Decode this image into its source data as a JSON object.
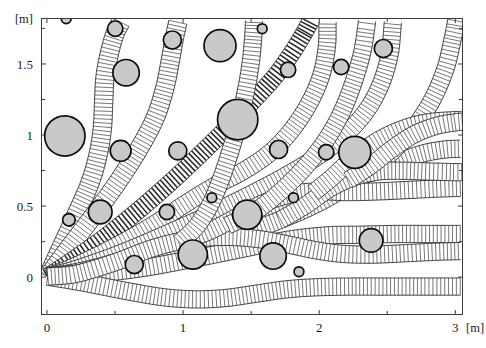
{
  "figure": {
    "type": "path-swath-obstacle-plot",
    "x_unit_label": "[m]",
    "y_unit_label": "[m]",
    "caption": ""
  },
  "axes": {
    "x": {
      "min": -0.04,
      "max": 3.06,
      "major_ticks": [
        0,
        1,
        2,
        3
      ],
      "major_labels": [
        "0",
        "1",
        "2",
        "3"
      ],
      "minor_ticks": [
        0.5,
        1.5,
        2.5
      ],
      "label": "[m]"
    },
    "y": {
      "min": -0.27,
      "max": 1.82,
      "major_ticks": [
        0,
        0.5,
        1,
        1.5
      ],
      "major_labels": [
        "0",
        "0.5",
        "1",
        "1.5"
      ],
      "minor_ticks": [
        0.25,
        0.75,
        1.25,
        1.75
      ],
      "label": "[m]"
    }
  },
  "plot_box_px": {
    "left": 41,
    "top": 18,
    "right": 463,
    "bottom": 315
  },
  "obstacles": [
    {
      "cx": 0.135,
      "cy": 0.99,
      "r": 0.145
    },
    {
      "cx": 0.165,
      "cy": 0.4,
      "r": 0.045
    },
    {
      "cx": 0.145,
      "cy": 1.815,
      "r": 0.035
    },
    {
      "cx": 0.395,
      "cy": 0.455,
      "r": 0.085
    },
    {
      "cx": 0.505,
      "cy": 1.745,
      "r": 0.055
    },
    {
      "cx": 0.545,
      "cy": 0.885,
      "r": 0.075
    },
    {
      "cx": 0.585,
      "cy": 1.435,
      "r": 0.095
    },
    {
      "cx": 0.645,
      "cy": 0.085,
      "r": 0.065
    },
    {
      "cx": 0.885,
      "cy": 0.455,
      "r": 0.055
    },
    {
      "cx": 0.925,
      "cy": 1.665,
      "r": 0.065
    },
    {
      "cx": 0.965,
      "cy": 0.885,
      "r": 0.065
    },
    {
      "cx": 1.075,
      "cy": 0.155,
      "r": 0.105
    },
    {
      "cx": 1.215,
      "cy": 0.555,
      "r": 0.035
    },
    {
      "cx": 1.275,
      "cy": 1.625,
      "r": 0.115
    },
    {
      "cx": 1.405,
      "cy": 1.105,
      "r": 0.145
    },
    {
      "cx": 1.475,
      "cy": 0.435,
      "r": 0.105
    },
    {
      "cx": 1.585,
      "cy": 1.745,
      "r": 0.035
    },
    {
      "cx": 1.665,
      "cy": 0.145,
      "r": 0.095
    },
    {
      "cx": 1.705,
      "cy": 0.895,
      "r": 0.065
    },
    {
      "cx": 1.775,
      "cy": 1.455,
      "r": 0.055
    },
    {
      "cx": 1.815,
      "cy": 0.555,
      "r": 0.035
    },
    {
      "cx": 1.855,
      "cy": 0.035,
      "r": 0.035
    },
    {
      "cx": 2.055,
      "cy": 0.875,
      "r": 0.055
    },
    {
      "cx": 2.165,
      "cy": 1.475,
      "r": 0.055
    },
    {
      "cx": 2.265,
      "cy": 0.875,
      "r": 0.115
    },
    {
      "cx": 2.385,
      "cy": 0.255,
      "r": 0.085
    },
    {
      "cx": 2.475,
      "cy": 1.605,
      "r": 0.065
    }
  ],
  "swaths": [
    {
      "id": "s1",
      "shade": "light",
      "half_width": 0.066,
      "pts": [
        [
          0.01,
          0.0
        ],
        [
          0.1,
          0.19
        ],
        [
          0.22,
          0.44
        ],
        [
          0.32,
          0.66
        ],
        [
          0.38,
          0.86
        ],
        [
          0.41,
          1.04
        ],
        [
          0.42,
          1.22
        ],
        [
          0.43,
          1.4
        ],
        [
          0.46,
          1.56
        ],
        [
          0.5,
          1.7
        ],
        [
          0.545,
          1.79
        ]
      ]
    },
    {
      "id": "s2",
      "shade": "light",
      "half_width": 0.066,
      "pts": [
        [
          0.01,
          0.0
        ],
        [
          0.14,
          0.17
        ],
        [
          0.33,
          0.41
        ],
        [
          0.52,
          0.66
        ],
        [
          0.68,
          0.9
        ],
        [
          0.8,
          1.12
        ],
        [
          0.87,
          1.33
        ],
        [
          0.91,
          1.52
        ],
        [
          0.94,
          1.68
        ],
        [
          0.965,
          1.79
        ]
      ]
    },
    {
      "id": "s3",
      "shade": "dark",
      "half_width": 0.062,
      "pts": [
        [
          0.01,
          0.0
        ],
        [
          0.17,
          0.1
        ],
        [
          0.42,
          0.27
        ],
        [
          0.68,
          0.47
        ],
        [
          0.93,
          0.68
        ],
        [
          1.14,
          0.87
        ],
        [
          1.33,
          1.05
        ],
        [
          1.52,
          1.24
        ],
        [
          1.68,
          1.41
        ],
        [
          1.8,
          1.57
        ],
        [
          1.89,
          1.71
        ],
        [
          1.94,
          1.8
        ]
      ]
    },
    {
      "id": "s4",
      "shade": "light",
      "half_width": 0.062,
      "pts": [
        [
          0.01,
          0.0
        ],
        [
          0.2,
          0.07
        ],
        [
          0.48,
          0.2
        ],
        [
          0.76,
          0.35
        ],
        [
          1.0,
          0.5
        ],
        [
          1.22,
          0.63
        ],
        [
          1.44,
          0.74
        ],
        [
          1.64,
          0.87
        ],
        [
          1.8,
          1.03
        ],
        [
          1.93,
          1.22
        ],
        [
          2.02,
          1.42
        ],
        [
          2.06,
          1.62
        ],
        [
          2.065,
          1.79
        ]
      ]
    },
    {
      "id": "s5",
      "shade": "light",
      "half_width": 0.062,
      "pts": [
        [
          0.01,
          0.0
        ],
        [
          0.24,
          0.06
        ],
        [
          0.56,
          0.17
        ],
        [
          0.88,
          0.3
        ],
        [
          1.18,
          0.43
        ],
        [
          1.46,
          0.56
        ],
        [
          1.72,
          0.69
        ],
        [
          1.95,
          0.82
        ],
        [
          2.15,
          0.96
        ],
        [
          2.33,
          1.14
        ],
        [
          2.45,
          1.34
        ],
        [
          2.52,
          1.56
        ],
        [
          2.545,
          1.79
        ]
      ]
    },
    {
      "id": "s6",
      "shade": "light",
      "half_width": 0.062,
      "pts": [
        [
          0.01,
          0.0
        ],
        [
          0.26,
          0.04
        ],
        [
          0.62,
          0.13
        ],
        [
          0.98,
          0.24
        ],
        [
          1.33,
          0.36
        ],
        [
          1.66,
          0.48
        ],
        [
          1.96,
          0.59
        ],
        [
          2.22,
          0.68
        ],
        [
          2.44,
          0.75
        ],
        [
          2.62,
          0.82
        ],
        [
          2.78,
          0.87
        ],
        [
          2.93,
          0.895
        ],
        [
          3.04,
          0.9
        ]
      ]
    },
    {
      "id": "s7",
      "shade": "light",
      "half_width": 0.062,
      "pts": [
        [
          0.01,
          0.0
        ],
        [
          0.28,
          0.03
        ],
        [
          0.66,
          0.1
        ],
        [
          1.04,
          0.19
        ],
        [
          1.4,
          0.29
        ],
        [
          1.72,
          0.4
        ],
        [
          2.0,
          0.52
        ],
        [
          2.25,
          0.66
        ],
        [
          2.47,
          0.82
        ],
        [
          2.66,
          1.0
        ],
        [
          2.82,
          1.22
        ],
        [
          2.93,
          1.46
        ],
        [
          2.99,
          1.7
        ],
        [
          3.01,
          1.8
        ]
      ]
    },
    {
      "id": "s8",
      "shade": "light",
      "half_width": 0.062,
      "pts": [
        [
          0.01,
          0.0
        ],
        [
          0.3,
          0.015
        ],
        [
          0.7,
          0.06
        ],
        [
          1.1,
          0.13
        ],
        [
          1.46,
          0.2
        ],
        [
          1.78,
          0.26
        ],
        [
          2.06,
          0.29
        ],
        [
          2.32,
          0.295
        ],
        [
          2.56,
          0.3
        ],
        [
          2.8,
          0.3
        ],
        [
          3.04,
          0.3
        ]
      ]
    },
    {
      "id": "s9",
      "shade": "light",
      "half_width": 0.062,
      "pts": [
        [
          0.01,
          0.0
        ],
        [
          0.26,
          -0.04
        ],
        [
          0.58,
          -0.1
        ],
        [
          0.86,
          -0.145
        ],
        [
          1.1,
          -0.16
        ],
        [
          1.32,
          -0.15
        ],
        [
          1.54,
          -0.12
        ],
        [
          1.76,
          -0.09
        ],
        [
          1.98,
          -0.075
        ],
        [
          2.22,
          -0.07
        ],
        [
          2.5,
          -0.07
        ],
        [
          2.78,
          -0.07
        ],
        [
          3.04,
          -0.07
        ]
      ]
    },
    {
      "id": "s10",
      "shade": "light",
      "half_width": 0.062,
      "pts": [
        [
          0.01,
          0.0
        ],
        [
          0.22,
          0.02
        ],
        [
          0.5,
          0.1
        ],
        [
          0.78,
          0.2
        ],
        [
          1.04,
          0.26
        ],
        [
          1.3,
          0.28
        ],
        [
          1.55,
          0.265
        ],
        [
          1.78,
          0.225
        ],
        [
          1.98,
          0.185
        ],
        [
          2.18,
          0.16
        ],
        [
          2.4,
          0.155
        ],
        [
          2.64,
          0.165
        ],
        [
          2.86,
          0.175
        ],
        [
          3.04,
          0.18
        ]
      ]
    },
    {
      "id": "s11",
      "shade": "light",
      "half_width": 0.062,
      "pts": [
        [
          1.04,
          0.26
        ],
        [
          1.22,
          0.33
        ],
        [
          1.42,
          0.43
        ],
        [
          1.6,
          0.52
        ],
        [
          1.8,
          0.58
        ],
        [
          2.0,
          0.6
        ],
        [
          2.22,
          0.595
        ],
        [
          2.44,
          0.6
        ],
        [
          2.66,
          0.61
        ],
        [
          2.88,
          0.62
        ],
        [
          3.04,
          0.625
        ]
      ]
    },
    {
      "id": "s12",
      "shade": "light",
      "half_width": 0.062,
      "pts": [
        [
          1.72,
          0.4
        ],
        [
          1.9,
          0.5
        ],
        [
          2.08,
          0.62
        ],
        [
          2.26,
          0.7
        ],
        [
          2.44,
          0.74
        ],
        [
          2.62,
          0.745
        ],
        [
          2.8,
          0.74
        ],
        [
          3.0,
          0.735
        ],
        [
          3.05,
          0.735
        ]
      ]
    },
    {
      "id": "s13",
      "shade": "light",
      "half_width": 0.062,
      "pts": [
        [
          1.33,
          0.36
        ],
        [
          1.5,
          0.44
        ],
        [
          1.66,
          0.55
        ],
        [
          1.82,
          0.69
        ],
        [
          1.96,
          0.84
        ],
        [
          2.08,
          1.0
        ],
        [
          2.18,
          1.18
        ],
        [
          2.26,
          1.38
        ],
        [
          2.32,
          1.58
        ],
        [
          2.35,
          1.76
        ],
        [
          2.355,
          1.8
        ]
      ]
    },
    {
      "id": "s14",
      "shade": "light",
      "half_width": 0.062,
      "pts": [
        [
          0.98,
          0.24
        ],
        [
          1.1,
          0.35
        ],
        [
          1.2,
          0.5
        ],
        [
          1.28,
          0.68
        ],
        [
          1.35,
          0.88
        ],
        [
          1.41,
          1.08
        ],
        [
          1.46,
          1.28
        ],
        [
          1.5,
          1.5
        ],
        [
          1.52,
          1.7
        ],
        [
          1.525,
          1.8
        ]
      ]
    },
    {
      "id": "s15",
      "shade": "light",
      "half_width": 0.062,
      "pts": [
        [
          1.96,
          0.59
        ],
        [
          2.1,
          0.7
        ],
        [
          2.26,
          0.84
        ],
        [
          2.44,
          0.96
        ],
        [
          2.62,
          1.04
        ],
        [
          2.8,
          1.085
        ],
        [
          2.98,
          1.1
        ],
        [
          3.05,
          1.1
        ]
      ]
    },
    {
      "id": "s16",
      "shade": "light",
      "half_width": 0.062,
      "pts": [
        [
          2.22,
          0.68
        ],
        [
          2.38,
          0.78
        ],
        [
          2.54,
          0.9
        ],
        [
          2.7,
          1.0
        ],
        [
          2.86,
          1.06
        ],
        [
          3.0,
          1.085
        ],
        [
          3.05,
          1.09
        ]
      ]
    }
  ]
}
